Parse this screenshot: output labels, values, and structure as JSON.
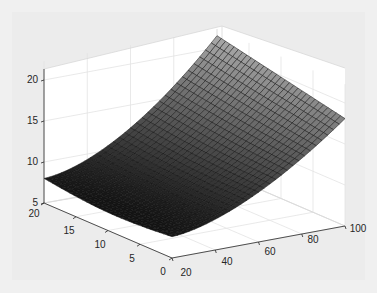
{
  "chart_data": {
    "type": "surface",
    "title": "",
    "xlabel": "",
    "ylabel": "",
    "zlabel": "",
    "x_axis": {
      "ticks": [
        20,
        40,
        60,
        80,
        100
      ],
      "range": [
        20,
        100
      ]
    },
    "y_axis": {
      "ticks": [
        0,
        5,
        10,
        15,
        20
      ],
      "range": [
        0,
        20
      ]
    },
    "z_axis": {
      "ticks": [
        5,
        10,
        15,
        20
      ],
      "range": [
        5,
        22
      ]
    },
    "grid": true,
    "colormap": "gray",
    "mesh": {
      "nx": 30,
      "ny": 30
    },
    "surface_description": "Surface rising from ~8 at low x to ~21 at high x (x=100, y=20 corner); concave-up along x, slight curvature along y",
    "corner_values": {
      "x20_y0": 7.5,
      "x20_y20": 8,
      "x100_y0": 18,
      "x100_y20": 21.5
    }
  },
  "labels": {
    "z": [
      "5",
      "10",
      "15",
      "20"
    ],
    "y": [
      "0",
      "5",
      "10",
      "15",
      "20"
    ],
    "x": [
      "20",
      "40",
      "60",
      "80",
      "100"
    ]
  }
}
